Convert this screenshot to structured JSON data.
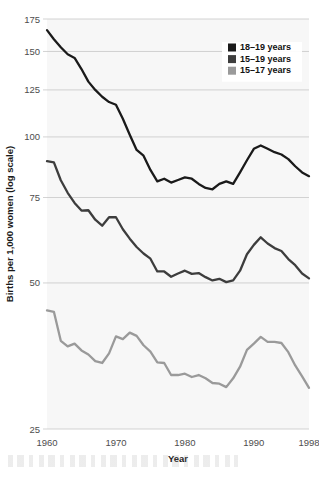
{
  "chart_data": {
    "type": "line",
    "title": "",
    "xlabel": "Year",
    "ylabel": "Births per 1,000 women (log scale)",
    "yscale": "log",
    "ylim": [
      25,
      175
    ],
    "xlim": [
      1960,
      1998
    ],
    "yticks": [
      25,
      50,
      75,
      100,
      125,
      150,
      175
    ],
    "ytick_labels": [
      "25",
      "50",
      "75",
      "100",
      "125",
      "150",
      "175"
    ],
    "xticks": [
      1960,
      1970,
      1980,
      1990,
      1998
    ],
    "xtick_labels": [
      "1960",
      "1970",
      "1980",
      "1990",
      "1998"
    ],
    "grid": "horizontal",
    "legend_position": "upper right",
    "x": [
      1960,
      1961,
      1962,
      1963,
      1964,
      1965,
      1966,
      1967,
      1968,
      1969,
      1970,
      1971,
      1972,
      1973,
      1974,
      1975,
      1976,
      1977,
      1978,
      1979,
      1980,
      1981,
      1982,
      1983,
      1984,
      1985,
      1986,
      1987,
      1988,
      1989,
      1990,
      1991,
      1992,
      1993,
      1994,
      1995,
      1996,
      1997,
      1998
    ],
    "series": [
      {
        "name": "18-19 years",
        "label": "18–19 years",
        "color": "#1a1a1a",
        "values": [
          166.0,
          159.0,
          153.0,
          148.0,
          145.5,
          138.0,
          130.0,
          125.0,
          121.0,
          118.0,
          116.5,
          109.0,
          101.0,
          94.0,
          91.5,
          85.5,
          81.0,
          82.0,
          80.5,
          81.5,
          82.5,
          82.0,
          80.0,
          78.5,
          78.0,
          80.0,
          81.0,
          80.0,
          84.5,
          89.5,
          94.5,
          96.0,
          94.5,
          93.0,
          92.0,
          90.0,
          87.0,
          84.5,
          83.0
        ]
      },
      {
        "name": "15-19 years",
        "label": "15–19 years",
        "color": "#3d3d3d",
        "values": [
          89.1,
          88.6,
          81.4,
          76.7,
          73.1,
          70.5,
          70.6,
          67.5,
          65.6,
          68.3,
          68.3,
          64.5,
          61.7,
          59.3,
          57.5,
          56.1,
          52.8,
          52.8,
          51.5,
          52.3,
          53.0,
          52.2,
          52.4,
          51.4,
          50.6,
          51.0,
          50.2,
          50.6,
          53.0,
          57.3,
          59.9,
          62.1,
          60.3,
          59.0,
          58.2,
          56.0,
          54.4,
          52.3,
          51.1
        ]
      },
      {
        "name": "15-17 years",
        "label": "15–17 years",
        "color": "#9a9a9a",
        "values": [
          43.9,
          43.6,
          38.0,
          37.0,
          37.5,
          36.3,
          35.6,
          34.5,
          34.2,
          35.8,
          38.8,
          38.3,
          39.5,
          38.9,
          37.2,
          36.1,
          34.3,
          34.2,
          32.3,
          32.3,
          32.5,
          32.0,
          32.3,
          31.8,
          31.1,
          31.0,
          30.5,
          31.8,
          33.6,
          36.4,
          37.5,
          38.7,
          37.8,
          37.8,
          37.6,
          36.0,
          33.8,
          32.1,
          30.4
        ]
      }
    ]
  },
  "legend": {
    "entries": [
      {
        "label": "18–19 years",
        "color": "#1a1a1a"
      },
      {
        "label": "15–19 years",
        "color": "#3d3d3d"
      },
      {
        "label": "15–17 years",
        "color": "#9a9a9a"
      }
    ]
  }
}
